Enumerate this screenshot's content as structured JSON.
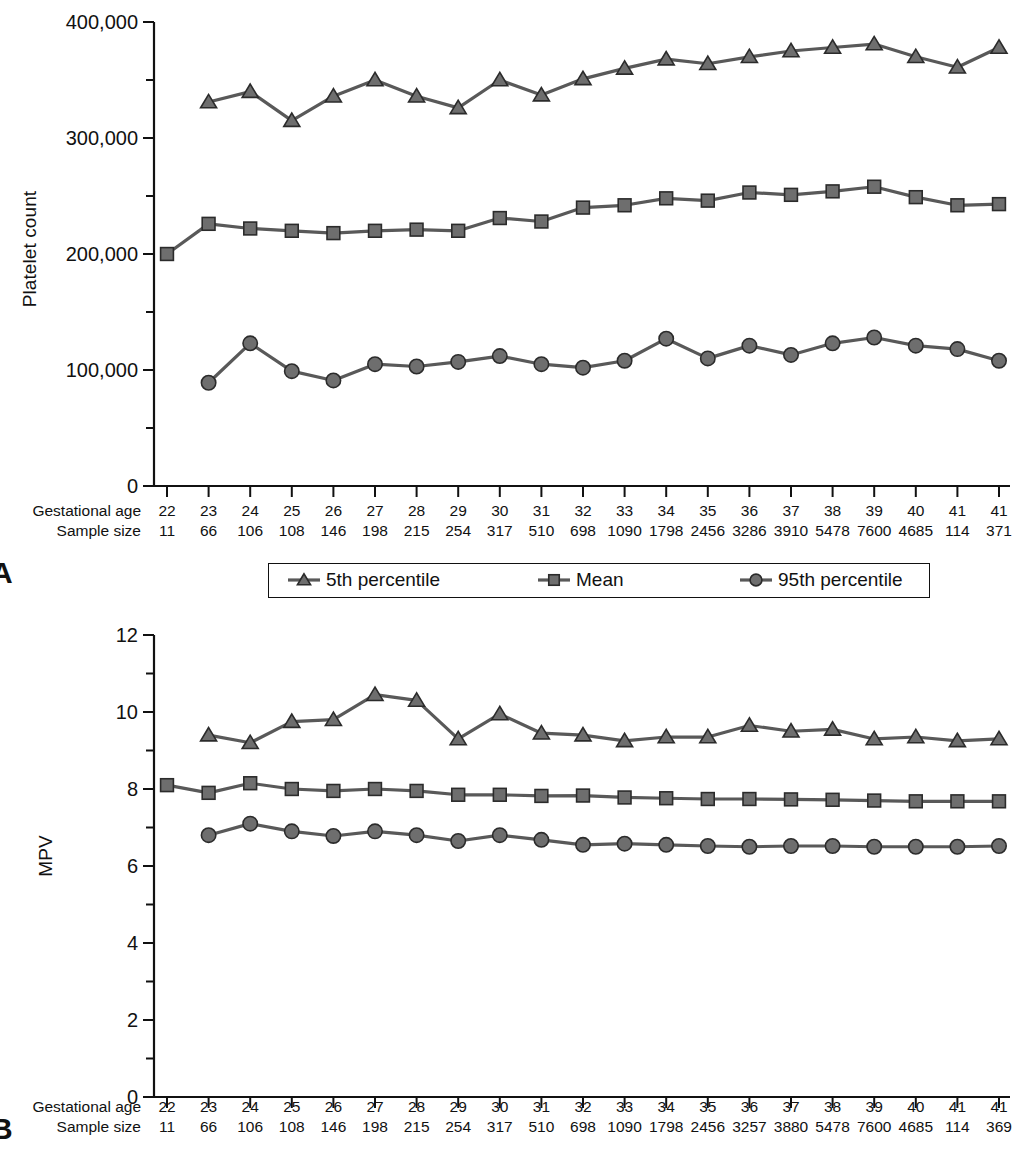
{
  "figure": {
    "panels": [
      {
        "letter": "A",
        "ylabel": "Platelet count",
        "yticks": [
          "400,000",
          "300,000",
          "200,000",
          "100,000",
          "0"
        ],
        "xrow_labels": [
          "Gestational age",
          "Sample size"
        ]
      },
      {
        "letter": "B",
        "ylabel": "MPV",
        "yticks": [
          "12",
          "10",
          "8",
          "6",
          "4",
          "2",
          "0"
        ],
        "xrow_labels": [
          "Gestational age",
          "Sample size"
        ]
      }
    ],
    "legend": {
      "items": [
        {
          "label": "5th percentile",
          "marker": "triangle"
        },
        {
          "label": "Mean",
          "marker": "square"
        },
        {
          "label": "95th percentile",
          "marker": "circle"
        }
      ]
    },
    "colors": {
      "line": "#595959",
      "marker_fill": "#6e6e6e",
      "marker_stroke": "#2b2b2b",
      "axis": "#111111"
    }
  },
  "chart_data": [
    {
      "id": "panel-a",
      "type": "line",
      "title": "",
      "panel_letter": "A",
      "xlabel": "Gestational age",
      "ylabel": "Platelet count",
      "ylim": [
        0,
        400000
      ],
      "yticks": [
        0,
        100000,
        200000,
        300000,
        400000
      ],
      "ytick_labels": [
        "0",
        "100,000",
        "200,000",
        "300,000",
        "400,000"
      ],
      "minor_ticks": true,
      "grid": false,
      "legend_position": "below-axis",
      "categories": [
        "22",
        "23",
        "24",
        "25",
        "26",
        "27",
        "28",
        "29",
        "30",
        "31",
        "32",
        "33",
        "34",
        "35",
        "36",
        "37",
        "38",
        "39",
        "40",
        "41",
        "41"
      ],
      "sample_size": [
        "11",
        "66",
        "106",
        "108",
        "146",
        "198",
        "215",
        "254",
        "317",
        "510",
        "698",
        "1090",
        "1798",
        "2456",
        "3286",
        "3910",
        "5478",
        "7600",
        "4685",
        "114",
        "371"
      ],
      "series": [
        {
          "name": "5th percentile",
          "marker": "triangle",
          "values": [
            null,
            331000,
            340000,
            315000,
            336000,
            350000,
            336000,
            326000,
            350000,
            337000,
            351000,
            360000,
            368000,
            364000,
            370000,
            375000,
            378000,
            381000,
            370000,
            361000,
            378000
          ]
        },
        {
          "name": "Mean",
          "marker": "square",
          "values": [
            200000,
            226000,
            222000,
            220000,
            218000,
            220000,
            221000,
            220000,
            231000,
            228000,
            240000,
            242000,
            248000,
            246000,
            253000,
            251000,
            254000,
            258000,
            249000,
            242000,
            243000
          ]
        },
        {
          "name": "95th percentile",
          "marker": "circle",
          "values": [
            null,
            89000,
            123000,
            99000,
            91000,
            105000,
            103000,
            107000,
            112000,
            105000,
            102000,
            108000,
            127000,
            110000,
            121000,
            113000,
            123000,
            128000,
            121000,
            118000,
            108000
          ]
        }
      ]
    },
    {
      "id": "panel-b",
      "type": "line",
      "title": "",
      "panel_letter": "B",
      "xlabel": "Gestational age",
      "ylabel": "MPV",
      "ylim": [
        0,
        12
      ],
      "yticks": [
        0,
        2,
        4,
        6,
        8,
        10,
        12
      ],
      "ytick_labels": [
        "0",
        "2",
        "4",
        "6",
        "8",
        "10",
        "12"
      ],
      "minor_ticks": true,
      "grid": false,
      "legend_position": "none",
      "categories": [
        "22",
        "23",
        "24",
        "25",
        "26",
        "27",
        "28",
        "29",
        "30",
        "31",
        "32",
        "33",
        "34",
        "35",
        "36",
        "37",
        "38",
        "39",
        "40",
        "41",
        "41"
      ],
      "sample_size": [
        "11",
        "66",
        "106",
        "108",
        "146",
        "198",
        "215",
        "254",
        "317",
        "510",
        "698",
        "1090",
        "1798",
        "2456",
        "3257",
        "3880",
        "5478",
        "7600",
        "4685",
        "114",
        "369"
      ],
      "series": [
        {
          "name": "5th percentile",
          "marker": "triangle",
          "values": [
            null,
            9.4,
            9.2,
            9.75,
            9.8,
            10.45,
            10.3,
            9.3,
            9.95,
            9.45,
            9.4,
            9.25,
            9.35,
            9.35,
            9.65,
            9.5,
            9.55,
            9.3,
            9.35,
            9.25,
            9.3
          ]
        },
        {
          "name": "Mean",
          "marker": "square",
          "values": [
            8.1,
            7.9,
            8.15,
            8.0,
            7.95,
            8.0,
            7.95,
            7.85,
            7.85,
            7.82,
            7.83,
            7.78,
            7.76,
            7.74,
            7.74,
            7.73,
            7.72,
            7.7,
            7.68,
            7.68,
            7.68
          ]
        },
        {
          "name": "95th percentile",
          "marker": "circle",
          "values": [
            null,
            6.8,
            7.1,
            6.9,
            6.78,
            6.9,
            6.8,
            6.65,
            6.8,
            6.68,
            6.55,
            6.58,
            6.55,
            6.52,
            6.5,
            6.52,
            6.52,
            6.5,
            6.5,
            6.5,
            6.52
          ]
        }
      ]
    }
  ]
}
